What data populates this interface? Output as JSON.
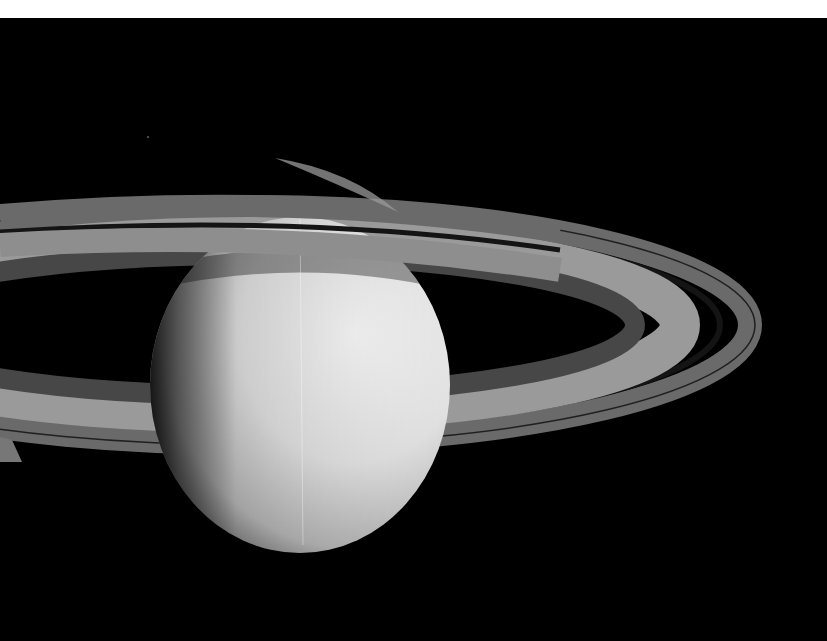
{
  "image": {
    "subject": "Saturn with rings",
    "style": "grayscale",
    "description": "Grayscale photograph of Saturn's sunlit crescent-lit globe with its ring system arcing across the frame against black space",
    "colors": {
      "space": "#000000",
      "top_border": "#ffffff",
      "planet_highlight": "#f4f4f4",
      "planet_shadow": "#3a3a3a",
      "ring_a": "#6e6e6e",
      "ring_b": "#9a9a9a",
      "ring_c": "#4a4a4a",
      "cassini_division": "#1a1a1a"
    }
  }
}
